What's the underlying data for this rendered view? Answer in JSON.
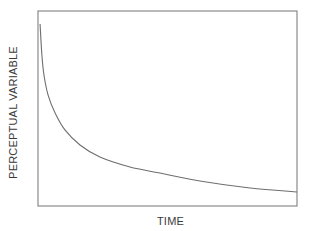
{
  "chart_data": {
    "type": "line",
    "title": "",
    "xlabel": "TIME",
    "ylabel": "PERCEPTUAL VARIABLE",
    "xlim": [
      0,
      1
    ],
    "ylim": [
      0,
      1
    ],
    "grid": false,
    "legend": "none",
    "x_ticks": [],
    "y_ticks": [],
    "series": [
      {
        "name": "perceptual-response",
        "color": "#6e6e6e",
        "x": [
          0.008,
          0.015,
          0.023,
          0.039,
          0.066,
          0.104,
          0.162,
          0.239,
          0.355,
          0.471,
          0.625,
          0.819,
          1.0
        ],
        "y": [
          0.933,
          0.774,
          0.672,
          0.569,
          0.477,
          0.39,
          0.313,
          0.251,
          0.2,
          0.169,
          0.128,
          0.092,
          0.072
        ]
      }
    ],
    "frame_color": "#8a8a8a"
  }
}
